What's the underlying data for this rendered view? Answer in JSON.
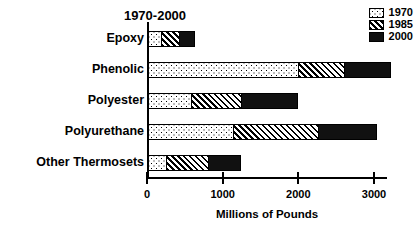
{
  "chart_data": {
    "type": "bar",
    "orientation": "horizontal",
    "stacked": true,
    "title": "1970-2000",
    "xlabel": "Millions of Pounds",
    "ylabel": "",
    "xlim": [
      0,
      3200
    ],
    "xticks": [
      0,
      1000,
      2000,
      3000
    ],
    "xtick_labels": [
      "0",
      "1000",
      "2000",
      "3000"
    ],
    "grid": false,
    "legend_position": "top-right",
    "categories": [
      "Epoxy",
      "Phenolic",
      "Polyester",
      "Polyurethane",
      "Other Thermosets"
    ],
    "series": [
      {
        "name": "1970",
        "pattern": "dotted",
        "values": [
          170,
          1980,
          570,
          1120,
          240
        ]
      },
      {
        "name": "1985",
        "pattern": "diagonal-hatch",
        "values": [
          240,
          610,
          660,
          1130,
          550
        ]
      },
      {
        "name": "2000",
        "pattern": "solid-black",
        "values": [
          190,
          590,
          720,
          750,
          410
        ]
      }
    ],
    "cumulative_totals": [
      600,
      3180,
      1950,
      3000,
      1200
    ]
  },
  "colors": {
    "ink": "#000000",
    "background": "#ffffff",
    "series_2000_fill": "#111111"
  },
  "legend": {
    "entries": [
      {
        "label": "1970",
        "swatch": "dotted-swatch"
      },
      {
        "label": "1985",
        "swatch": "hatched-swatch"
      },
      {
        "label": "2000",
        "swatch": "solid-black-swatch"
      }
    ]
  }
}
